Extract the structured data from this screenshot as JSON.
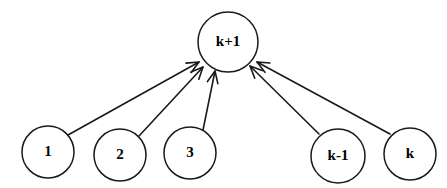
{
  "diagram": {
    "background_color": "#ffffff",
    "stroke_color": "#1a1a1a",
    "text_color": "#000000",
    "nodes": [
      {
        "id": "k+1",
        "label": "k+1",
        "cx": 228,
        "cy": 42,
        "r": 30,
        "font_size": 15
      },
      {
        "id": "1",
        "label": "1",
        "cx": 48,
        "cy": 152,
        "r": 26,
        "font_size": 15
      },
      {
        "id": "2",
        "label": "2",
        "cx": 120,
        "cy": 155,
        "r": 26,
        "font_size": 15
      },
      {
        "id": "3",
        "label": "3",
        "cx": 190,
        "cy": 153,
        "r": 26,
        "font_size": 15
      },
      {
        "id": "k-1",
        "label": "k-1",
        "cx": 338,
        "cy": 156,
        "r": 27,
        "font_size": 15
      },
      {
        "id": "k",
        "label": "k",
        "cx": 410,
        "cy": 154,
        "r": 26,
        "font_size": 15
      }
    ],
    "edges": [
      {
        "from": "1",
        "to": "k+1",
        "x1": 68,
        "y1": 135,
        "x2": 199,
        "y2": 62,
        "directed": true
      },
      {
        "from": "2",
        "to": "k+1",
        "x1": 139,
        "y1": 136,
        "x2": 203,
        "y2": 67,
        "directed": true
      },
      {
        "from": "3",
        "to": "k+1",
        "x1": 203,
        "y1": 130,
        "x2": 215,
        "y2": 71,
        "directed": true
      },
      {
        "from": "k-1",
        "to": "k+1",
        "x1": 319,
        "y1": 134,
        "x2": 250,
        "y2": 66,
        "directed": true
      },
      {
        "from": "k",
        "to": "k+1",
        "x1": 390,
        "y1": 134,
        "x2": 257,
        "y2": 62,
        "directed": true
      }
    ]
  }
}
